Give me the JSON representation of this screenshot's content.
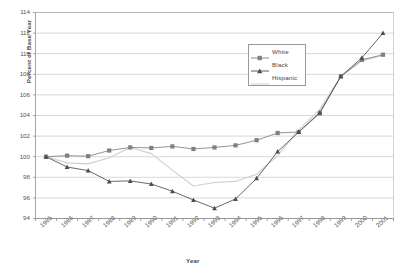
{
  "chart_data": {
    "type": "line",
    "title": "",
    "xlabel": "Year",
    "ylabel": "Percent of Base Year",
    "x": [
      1985,
      1986,
      1987,
      1988,
      1989,
      1990,
      1991,
      1992,
      1993,
      1994,
      1995,
      1996,
      1997,
      1998,
      1999,
      2000,
      2001
    ],
    "xtick_labels": [
      "1985",
      "1986",
      "1987",
      "1988",
      "1989",
      "1990",
      "1991",
      "1992",
      "1993",
      "1994",
      "1995",
      "1996",
      "1997",
      "1998",
      "1999",
      "2000",
      "2001"
    ],
    "ylim": [
      94,
      114
    ],
    "ytick_labels": [
      "94",
      "96",
      "98",
      "100",
      "102",
      "104",
      "106",
      "108",
      "110",
      "112",
      "114"
    ],
    "yticks": [
      94,
      96,
      98,
      100,
      102,
      104,
      106,
      108,
      110,
      112,
      114
    ],
    "grid": true,
    "legend_position": "upper-right",
    "series": [
      {
        "name": "White",
        "marker": "square",
        "color": "#808080",
        "values": [
          100.0,
          100.1,
          100.05,
          100.6,
          100.9,
          100.85,
          101.0,
          100.75,
          100.9,
          101.1,
          101.6,
          102.3,
          102.4,
          104.2,
          107.8,
          109.4,
          109.9
        ]
      },
      {
        "name": "Black",
        "marker": "triangle",
        "color": "#4d4d4d",
        "values": [
          100.0,
          99.0,
          98.65,
          97.6,
          97.65,
          97.35,
          96.65,
          95.8,
          95.0,
          95.9,
          97.9,
          100.5,
          102.4,
          104.3,
          107.8,
          109.6,
          112.0
        ]
      },
      {
        "name": "Hispanic",
        "marker": "none",
        "color": "#cfcfcf",
        "values": [
          100.0,
          99.4,
          99.3,
          99.9,
          100.9,
          100.3,
          98.7,
          97.15,
          97.5,
          97.6,
          98.3,
          100.1,
          102.6,
          104.6,
          107.8,
          109.3,
          109.85
        ]
      }
    ]
  },
  "legend": {
    "items": [
      {
        "label": "White"
      },
      {
        "label": "Black"
      },
      {
        "label": "Hispanic"
      }
    ]
  }
}
